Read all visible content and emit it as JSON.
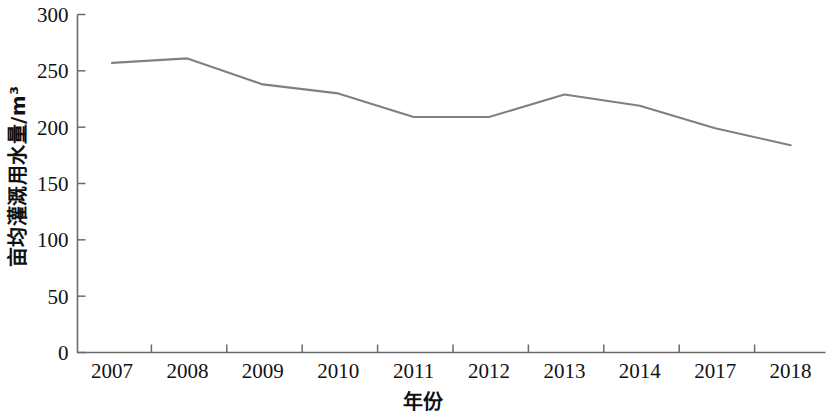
{
  "chart_data": {
    "type": "line",
    "title": "",
    "subtitle": "",
    "xlabel": "年份",
    "ylabel": "亩均灌溉用水量/m³",
    "categories": [
      "2007",
      "2008",
      "2009",
      "2010",
      "2011",
      "2012",
      "2013",
      "2014",
      "2017",
      "2018"
    ],
    "series": [
      {
        "name": "亩均灌溉用水量",
        "color": "#808080",
        "values": [
          257,
          261,
          238,
          230,
          209,
          209,
          229,
          219,
          199,
          184
        ]
      }
    ],
    "ylim": [
      0,
      300
    ],
    "y_ticks": [
      0,
      50,
      100,
      150,
      200,
      250,
      300
    ],
    "y_tick_labels": [
      "0",
      "50",
      "100",
      "150",
      "200",
      "250",
      "300"
    ],
    "x_tick_labels": [
      "2007",
      "2008",
      "2009",
      "2010",
      "2011",
      "2012",
      "2013",
      "2014",
      "2017",
      "2018"
    ],
    "grid": false,
    "legend": false,
    "legend_position": "none",
    "line_color": "#808080",
    "axis_color": "#6b6b6b",
    "background_color": "#ffffff"
  }
}
